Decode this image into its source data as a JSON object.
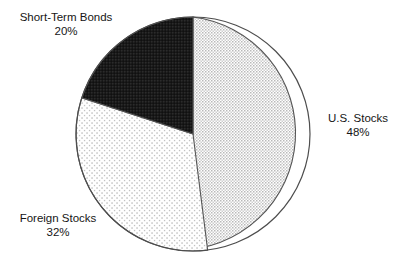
{
  "title_fragment": "Recommended Asset Allocation",
  "chart_data": {
    "type": "pie",
    "title": "Recommended Asset Allocation",
    "subtitle": "",
    "xlabel": "",
    "ylabel": "",
    "legend_position": "callout-labels",
    "grid": false,
    "start_angle_deg": 0,
    "direction": "clockwise",
    "units": "percent",
    "categories": [
      "U.S. Stocks",
      "Foreign Stocks",
      "Short-Term Bonds"
    ],
    "values": [
      48,
      32,
      20
    ],
    "slices": [
      {
        "label": "U.S. Stocks",
        "percent": 48,
        "percent_text": "48%",
        "fill_style": "light-gray-checker-dither",
        "fill_color": "#d9d9d9",
        "start_angle_deg": 0,
        "end_angle_deg": 172.8,
        "label_side": "right"
      },
      {
        "label": "Foreign Stocks",
        "percent": 32,
        "percent_text": "32%",
        "fill_style": "sparse-dot-stipple",
        "fill_color": "#f2f2f2",
        "start_angle_deg": 172.8,
        "end_angle_deg": 288.0,
        "label_side": "bottom-left"
      },
      {
        "label": "Short-Term Bonds",
        "percent": 20,
        "percent_text": "20%",
        "fill_style": "solid-black",
        "fill_color": "#1c1c1c",
        "start_angle_deg": 288.0,
        "end_angle_deg": 360.0,
        "label_side": "top-left"
      }
    ],
    "total": 100,
    "outline_color": "#4d4d4d",
    "background_color": "#ffffff"
  },
  "labels": {
    "us_stocks": {
      "name": "U.S. Stocks",
      "pct": "48%"
    },
    "foreign_stocks": {
      "name": "Foreign Stocks",
      "pct": "32%"
    },
    "short_term_bonds": {
      "name": "Short-Term Bonds",
      "pct": "20%"
    }
  }
}
